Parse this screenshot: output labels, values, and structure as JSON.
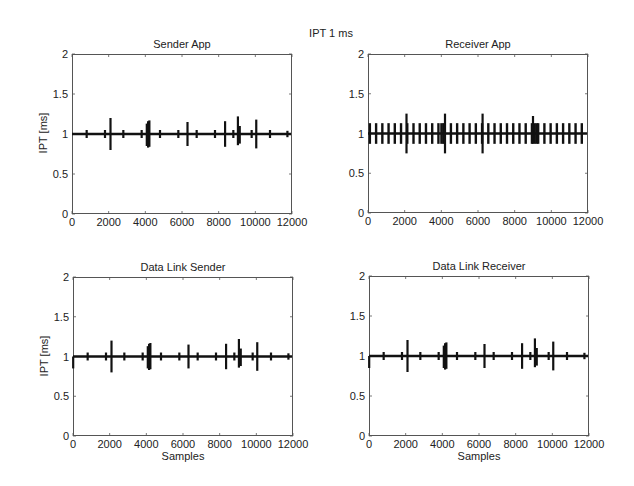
{
  "suptitle": "IPT 1 ms",
  "chart_data": [
    {
      "type": "line",
      "title": "Sender App",
      "xlabel": "",
      "ylabel": "IPT [ms]",
      "xlim": [
        0,
        12000
      ],
      "ylim": [
        0,
        2
      ],
      "xticks": [
        "0",
        "2000",
        "4000",
        "6000",
        "8000",
        "10000",
        "12000"
      ],
      "yticks": [
        "0",
        "0.5",
        "1",
        "1.5",
        "2"
      ],
      "grid": false,
      "baseline": 1.0,
      "spikes": [
        {
          "x": 800,
          "min": 0.95,
          "max": 1.05
        },
        {
          "x": 1800,
          "min": 0.95,
          "max": 1.05
        },
        {
          "x": 2100,
          "min": 0.8,
          "max": 1.2
        },
        {
          "x": 2800,
          "min": 0.95,
          "max": 1.05
        },
        {
          "x": 3800,
          "min": 0.95,
          "max": 1.05
        },
        {
          "x": 4080,
          "min": 0.85,
          "max": 1.13
        },
        {
          "x": 4150,
          "min": 0.83,
          "max": 1.16
        },
        {
          "x": 4220,
          "min": 0.84,
          "max": 1.17
        },
        {
          "x": 4800,
          "min": 0.95,
          "max": 1.05
        },
        {
          "x": 5800,
          "min": 0.95,
          "max": 1.05
        },
        {
          "x": 6300,
          "min": 0.85,
          "max": 1.15
        },
        {
          "x": 6800,
          "min": 0.95,
          "max": 1.05
        },
        {
          "x": 7800,
          "min": 0.95,
          "max": 1.05
        },
        {
          "x": 8350,
          "min": 0.84,
          "max": 1.16
        },
        {
          "x": 8800,
          "min": 0.95,
          "max": 1.05
        },
        {
          "x": 9050,
          "min": 0.86,
          "max": 1.22
        },
        {
          "x": 9150,
          "min": 0.88,
          "max": 1.1
        },
        {
          "x": 9800,
          "min": 0.95,
          "max": 1.05
        },
        {
          "x": 10050,
          "min": 0.82,
          "max": 1.18
        },
        {
          "x": 10800,
          "min": 0.95,
          "max": 1.05
        },
        {
          "x": 11750,
          "min": 0.96,
          "max": 1.04
        }
      ]
    },
    {
      "type": "line",
      "title": "Receiver App",
      "xlabel": "",
      "ylabel": "",
      "xlim": [
        0,
        12000
      ],
      "ylim": [
        0,
        2
      ],
      "xticks": [
        "0",
        "2000",
        "4000",
        "6000",
        "8000",
        "10000",
        "12000"
      ],
      "yticks": [
        "0",
        "0.5",
        "1",
        "1.5",
        "2"
      ],
      "grid": false,
      "baseline": 1.0,
      "periodic_spike": {
        "start": 0,
        "period": 340,
        "min": 0.87,
        "max": 1.13
      },
      "spikes": [
        {
          "x": 2100,
          "min": 0.75,
          "max": 1.25
        },
        {
          "x": 4000,
          "min": 0.87,
          "max": 1.13
        },
        {
          "x": 4100,
          "min": 0.87,
          "max": 1.13
        },
        {
          "x": 4200,
          "min": 0.75,
          "max": 1.25
        },
        {
          "x": 6250,
          "min": 0.75,
          "max": 1.25
        },
        {
          "x": 9000,
          "min": 0.87,
          "max": 1.22
        },
        {
          "x": 9100,
          "min": 0.87,
          "max": 1.13
        },
        {
          "x": 9200,
          "min": 0.87,
          "max": 1.13
        }
      ]
    },
    {
      "type": "line",
      "title": "Data Link Sender",
      "xlabel": "Samples",
      "ylabel": "IPT [ms]",
      "xlim": [
        0,
        12000
      ],
      "ylim": [
        0,
        2
      ],
      "xticks": [
        "0",
        "2000",
        "4000",
        "6000",
        "8000",
        "10000",
        "12000"
      ],
      "yticks": [
        "0",
        "0.5",
        "1",
        "1.5",
        "2"
      ],
      "grid": false,
      "baseline": 1.0,
      "spikes": [
        {
          "x": 10,
          "min": 0.85,
          "max": 1.0
        },
        {
          "x": 800,
          "min": 0.95,
          "max": 1.05
        },
        {
          "x": 1800,
          "min": 0.95,
          "max": 1.05
        },
        {
          "x": 2100,
          "min": 0.8,
          "max": 1.2
        },
        {
          "x": 2800,
          "min": 0.95,
          "max": 1.05
        },
        {
          "x": 3800,
          "min": 0.95,
          "max": 1.05
        },
        {
          "x": 4080,
          "min": 0.85,
          "max": 1.13
        },
        {
          "x": 4150,
          "min": 0.83,
          "max": 1.16
        },
        {
          "x": 4220,
          "min": 0.84,
          "max": 1.17
        },
        {
          "x": 4800,
          "min": 0.95,
          "max": 1.05
        },
        {
          "x": 5800,
          "min": 0.95,
          "max": 1.05
        },
        {
          "x": 6300,
          "min": 0.85,
          "max": 1.15
        },
        {
          "x": 6800,
          "min": 0.95,
          "max": 1.05
        },
        {
          "x": 7800,
          "min": 0.95,
          "max": 1.05
        },
        {
          "x": 8350,
          "min": 0.84,
          "max": 1.16
        },
        {
          "x": 8800,
          "min": 0.95,
          "max": 1.05
        },
        {
          "x": 9050,
          "min": 0.86,
          "max": 1.22
        },
        {
          "x": 9150,
          "min": 0.88,
          "max": 1.1
        },
        {
          "x": 9800,
          "min": 0.95,
          "max": 1.05
        },
        {
          "x": 10050,
          "min": 0.82,
          "max": 1.18
        },
        {
          "x": 10800,
          "min": 0.95,
          "max": 1.05
        },
        {
          "x": 11750,
          "min": 0.96,
          "max": 1.04
        }
      ]
    },
    {
      "type": "line",
      "title": "Data Link Receiver",
      "xlabel": "Samples",
      "ylabel": "",
      "xlim": [
        0,
        12000
      ],
      "ylim": [
        0,
        2
      ],
      "xticks": [
        "0",
        "2000",
        "4000",
        "6000",
        "8000",
        "10000",
        "12000"
      ],
      "yticks": [
        "0",
        "0.5",
        "1",
        "1.5",
        "2"
      ],
      "grid": false,
      "baseline": 1.0,
      "spikes": [
        {
          "x": 10,
          "min": 0.85,
          "max": 1.0
        },
        {
          "x": 800,
          "min": 0.95,
          "max": 1.05
        },
        {
          "x": 1800,
          "min": 0.95,
          "max": 1.05
        },
        {
          "x": 2100,
          "min": 0.8,
          "max": 1.2
        },
        {
          "x": 2800,
          "min": 0.95,
          "max": 1.05
        },
        {
          "x": 3800,
          "min": 0.95,
          "max": 1.05
        },
        {
          "x": 4080,
          "min": 0.85,
          "max": 1.13
        },
        {
          "x": 4150,
          "min": 0.83,
          "max": 1.16
        },
        {
          "x": 4220,
          "min": 0.84,
          "max": 1.17
        },
        {
          "x": 4800,
          "min": 0.95,
          "max": 1.05
        },
        {
          "x": 5800,
          "min": 0.95,
          "max": 1.05
        },
        {
          "x": 6300,
          "min": 0.85,
          "max": 1.15
        },
        {
          "x": 6800,
          "min": 0.95,
          "max": 1.05
        },
        {
          "x": 7800,
          "min": 0.95,
          "max": 1.05
        },
        {
          "x": 8350,
          "min": 0.84,
          "max": 1.16
        },
        {
          "x": 8800,
          "min": 0.95,
          "max": 1.05
        },
        {
          "x": 9050,
          "min": 0.86,
          "max": 1.22
        },
        {
          "x": 9150,
          "min": 0.88,
          "max": 1.1
        },
        {
          "x": 9800,
          "min": 0.95,
          "max": 1.05
        },
        {
          "x": 10050,
          "min": 0.82,
          "max": 1.18
        },
        {
          "x": 10800,
          "min": 0.95,
          "max": 1.05
        },
        {
          "x": 11750,
          "min": 0.96,
          "max": 1.04
        }
      ]
    }
  ],
  "colors": {
    "line": "#111111",
    "axes": "#555555",
    "text": "#222222"
  }
}
